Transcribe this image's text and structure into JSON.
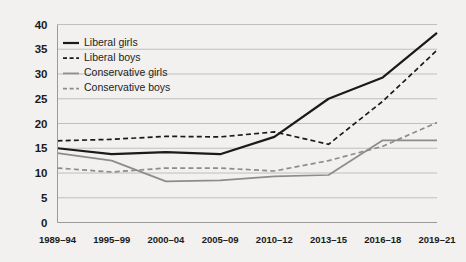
{
  "chart_data": {
    "type": "line",
    "title": "",
    "subtitle": "",
    "xlabel": "",
    "ylabel": "",
    "categories": [
      "1989–94",
      "1995–99",
      "2000–04",
      "2005–09",
      "2010–12",
      "2013–15",
      "2016–18",
      "2019–21"
    ],
    "ylim": [
      0,
      40
    ],
    "yticks": [
      0,
      5,
      10,
      15,
      20,
      25,
      30,
      35,
      40
    ],
    "ytick_labels": [
      "0",
      "5",
      "10",
      "15",
      "20",
      "25",
      "30",
      "35",
      "40"
    ],
    "grid": true,
    "legend_position": "upper-left-inside",
    "series": [
      {
        "name": "Liberal girls",
        "style": "solid",
        "color": "#1a1a1a",
        "width": 2.2,
        "values": [
          15.0,
          13.8,
          14.2,
          13.8,
          17.3,
          25.0,
          29.3,
          38.3
        ]
      },
      {
        "name": "Liberal boys",
        "style": "dashed",
        "color": "#1a1a1a",
        "width": 1.7,
        "values": [
          16.5,
          16.8,
          17.4,
          17.3,
          18.3,
          15.8,
          24.5,
          34.8
        ]
      },
      {
        "name": "Conservative girls",
        "style": "solid",
        "color": "#8c8c8c",
        "width": 1.7,
        "values": [
          14.0,
          12.5,
          8.3,
          8.5,
          9.3,
          9.6,
          16.6,
          16.6
        ]
      },
      {
        "name": "Conservative boys",
        "style": "dashed",
        "color": "#8c8c8c",
        "width": 1.7,
        "values": [
          11.0,
          10.2,
          11.0,
          11.0,
          10.4,
          12.5,
          15.4,
          20.2
        ]
      }
    ]
  },
  "legend": {
    "items": [
      {
        "label": "Liberal girls"
      },
      {
        "label": "Liberal boys"
      },
      {
        "label": "Conservative girls"
      },
      {
        "label": "Conservative boys"
      }
    ]
  },
  "colors": {
    "background": "#f2f1ef",
    "grid": "#b9b9b9",
    "axis": "#9a9a9a",
    "dark_series": "#1a1a1a",
    "gray_series": "#8c8c8c",
    "text": "#1a1a1a"
  }
}
